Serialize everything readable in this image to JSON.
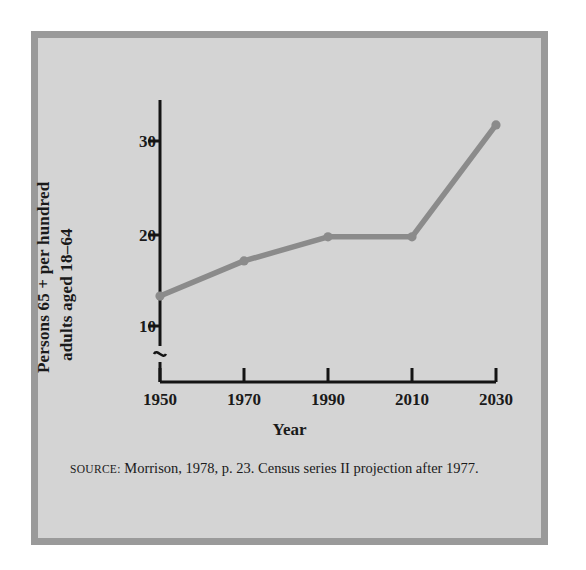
{
  "figure": {
    "background_color": "#d4d4d4",
    "border_color": "#9a9a9a",
    "page_background": "#ffffff"
  },
  "source_note": {
    "keyword": "Source:",
    "text": "Morrison, 1978, p. 23. Census series II projection after 1977."
  },
  "chart_data": {
    "type": "line",
    "title": "",
    "subtitle": "",
    "xlabel": "Year",
    "ylabel": "Persons 65 + per hundred adults aged 18–64",
    "ylabel_lines": [
      "Persons 65 + per hundred",
      "adults aged 18–64"
    ],
    "categories": [
      "1950",
      "1970",
      "1990",
      "2010",
      "2030"
    ],
    "x": [
      1950,
      1970,
      1990,
      2010,
      2030
    ],
    "values": [
      13.4,
      17.2,
      19.8,
      19.8,
      31.9
    ],
    "series": [
      {
        "name": "Persons 65 + per hundred adults aged 18–64",
        "values": [
          13.4,
          17.2,
          19.8,
          19.8,
          31.9
        ]
      }
    ],
    "xtick_labels": [
      "1950",
      "1970",
      "1990",
      "2010",
      "2030"
    ],
    "ytick_labels": [
      "10",
      "20",
      "30"
    ],
    "yticks": [
      10,
      20,
      30
    ],
    "ylim": [
      8.5,
      34
    ],
    "xlim": [
      1950,
      2030
    ],
    "y_axis_break": true,
    "y_axis_break_symbol": "∿",
    "grid": false,
    "legend": false,
    "legend_position": "none",
    "line_color": "#8b8b8b",
    "marker": "circle",
    "marker_color": "#8b8b8b",
    "axis_color": "#141414"
  }
}
